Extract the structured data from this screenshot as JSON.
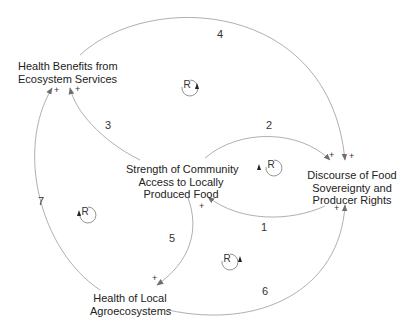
{
  "nodes": {
    "health_benefits": "Health Benefits from\nEcosystem Services",
    "health_benefits_l1": "Health Benefits from",
    "health_benefits_l2": "Ecosystem Services",
    "strength_l1": "Strength of Community",
    "strength_l2": "Access to Locally",
    "strength_l3": "Produced Food",
    "discourse_l1": "Discourse of Food",
    "discourse_l2": "Sovereignty and",
    "discourse_l3": "Producer Rights",
    "agro_l1": "Health of Local",
    "agro_l2": "Agroecosystems"
  },
  "links": [
    {
      "id": "1",
      "from": "Discourse of Food Sovereignty and Producer Rights",
      "to": "Strength of Community Access to Locally Produced Food",
      "polarity": "+"
    },
    {
      "id": "2",
      "from": "Strength of Community Access to Locally Produced Food",
      "to": "Discourse of Food Sovereignty and Producer Rights",
      "polarity": "+"
    },
    {
      "id": "3",
      "from": "Strength of Community Access to Locally Produced Food",
      "to": "Health Benefits from Ecosystem Services",
      "polarity": "+"
    },
    {
      "id": "4",
      "from": "Health Benefits from Ecosystem Services",
      "to": "Discourse of Food Sovereignty and Producer Rights",
      "polarity": "+"
    },
    {
      "id": "5",
      "from": "Strength of Community Access to Locally Produced Food",
      "to": "Health of Local Agroecosystems",
      "polarity": "+"
    },
    {
      "id": "6",
      "from": "Health of Local Agroecosystems",
      "to": "Discourse of Food Sovereignty and Producer Rights",
      "polarity": "+"
    },
    {
      "id": "7",
      "from": "Health of Local Agroecosystems",
      "to": "Health Benefits from Ecosystem Services",
      "polarity": "+"
    }
  ],
  "link_labels": [
    "1",
    "2",
    "3",
    "4",
    "5",
    "6",
    "7"
  ],
  "polarity": "+",
  "loops": [
    {
      "type": "R",
      "direction": "counterclockwise"
    },
    {
      "type": "R",
      "direction": "counterclockwise"
    },
    {
      "type": "R",
      "direction": "counterclockwise"
    },
    {
      "type": "R",
      "direction": "counterclockwise"
    }
  ],
  "colors": {
    "arc": "#a8a8a8",
    "arrowhead": "#6e6e6e",
    "text": "#222222"
  }
}
